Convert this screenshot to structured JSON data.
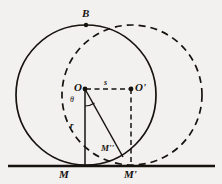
{
  "figure": {
    "background_color": "#f2f1ef",
    "ink_color": "#16130f",
    "labels": {
      "top_point": "B",
      "center_left": "O",
      "center_right": "O'",
      "distance_centers": "s",
      "radius": "r",
      "angle": "θ",
      "foot_left": "M",
      "foot_right": "M'",
      "intersection": "M''"
    },
    "geometry": {
      "ground_line": {
        "y": 166,
        "x_start": 8,
        "x_end": 215
      },
      "circle_solid": {
        "cx": 86,
        "cy": 95,
        "r": 70,
        "style": "solid"
      },
      "circle_dashed": {
        "cx": 132,
        "cy": 95,
        "r": 70,
        "style": "dashed"
      },
      "point_O": {
        "x": 85,
        "y": 89
      },
      "point_O_prime": {
        "x": 131,
        "y": 89
      },
      "point_B": {
        "x": 86,
        "y": 25
      },
      "point_M": {
        "x": 85,
        "y": 166
      },
      "point_M_prime": {
        "x": 131,
        "y": 166
      },
      "point_M_double_prime": {
        "x": 122,
        "y": 156
      },
      "segment_OM": {
        "style": "solid",
        "label": "r"
      },
      "segment_OMpp": {
        "style": "solid"
      },
      "segment_OOp": {
        "style": "dashed",
        "label": "s"
      },
      "segment_OpMp": {
        "style": "dashed"
      },
      "angle_arc": {
        "vertex": "O",
        "label": "θ"
      }
    }
  }
}
